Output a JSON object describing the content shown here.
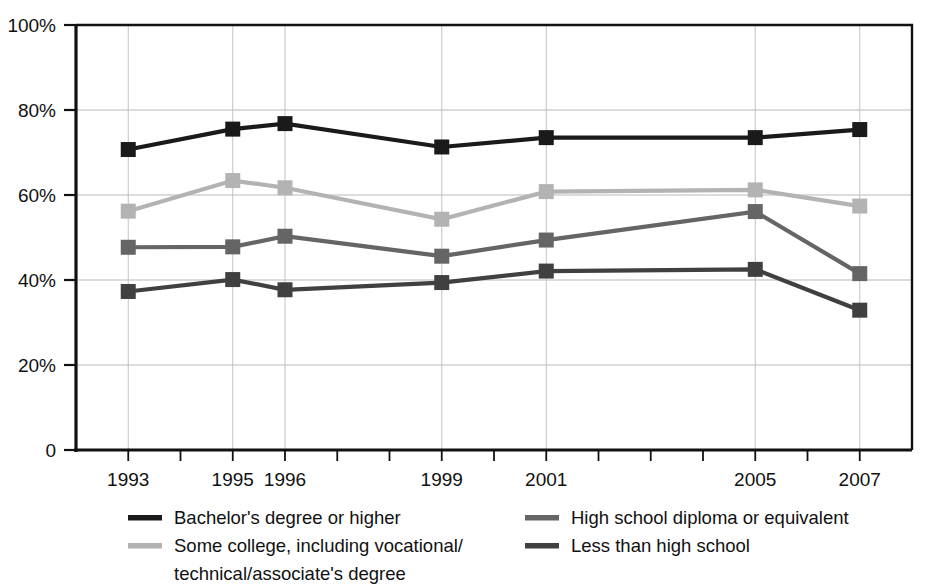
{
  "chart_data": {
    "type": "line",
    "title": "",
    "subtitle": "",
    "xlabel": "",
    "ylabel": "",
    "x": [
      1993,
      1995,
      1996,
      1999,
      2001,
      2005,
      2007
    ],
    "categories": [
      "1993",
      "1995",
      "1996",
      "1999",
      "2001",
      "2005",
      "2007"
    ],
    "xlim": [
      1992,
      2008
    ],
    "ylim": [
      0,
      100
    ],
    "yticks": [
      0,
      20,
      40,
      60,
      80,
      100
    ],
    "ytick_labels": [
      "0",
      "20%",
      "40%",
      "60%",
      "80%",
      "100%"
    ],
    "xtick_labels": [
      "1993",
      "1995",
      "1996",
      "1999",
      "2001",
      "2005",
      "2007"
    ],
    "x_minor_ticks": [
      1993,
      1994,
      1995,
      1996,
      1997,
      1998,
      1999,
      2000,
      2001,
      2002,
      2003,
      2004,
      2005,
      2006,
      2007
    ],
    "grid": "horizontal-and-vertical",
    "legend_position": "bottom",
    "marker": "square",
    "series": [
      {
        "name": "Bachelor's degree or higher",
        "color": "#1a1a1a",
        "values": [
          70.7,
          75.5,
          76.8,
          71.3,
          73.5,
          73.5,
          75.4
        ]
      },
      {
        "name": "Some college, including vocational/technical/associate's degree",
        "color": "#b3b3b3",
        "values": [
          56.2,
          63.4,
          61.7,
          54.3,
          60.8,
          61.2,
          57.4
        ]
      },
      {
        "name": "High school diploma or equivalent",
        "color": "#656565",
        "values": [
          47.7,
          47.8,
          50.3,
          45.6,
          49.4,
          56.1,
          41.5
        ]
      },
      {
        "name": "Less than high school",
        "color": "#404040",
        "values": [
          37.3,
          40.1,
          37.7,
          39.4,
          42.1,
          42.5,
          32.9
        ]
      }
    ]
  },
  "legend": {
    "entries": [
      {
        "label": "Bachelor's degree or higher",
        "color": "#1a1a1a",
        "column": 0,
        "row": 0
      },
      {
        "label": "Some college, including vocational/",
        "color": "#b3b3b3",
        "column": 0,
        "row": 1
      },
      {
        "label": "technical/associate's degree",
        "color": "",
        "column": 0,
        "row": 2
      },
      {
        "label": "High school diploma or equivalent",
        "color": "#656565",
        "column": 1,
        "row": 0
      },
      {
        "label": "Less than high school",
        "color": "#404040",
        "column": 1,
        "row": 1
      }
    ]
  },
  "colors": {
    "background": "#ffffff",
    "axis": "#111111",
    "gridline": "#b9b9b9",
    "bachelors": "#1a1a1a",
    "some_college": "#b3b3b3",
    "high_school": "#656565",
    "less_than_high_school": "#404040"
  }
}
